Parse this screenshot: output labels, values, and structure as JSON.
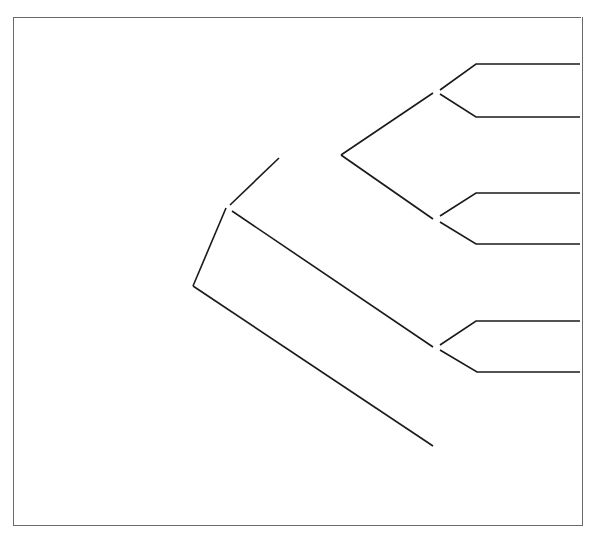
{
  "figure": {
    "caption": "A basic decision tree."
  },
  "nodes": {
    "decision1": {
      "line1": "DECISION",
      "line2": "1"
    },
    "decision2": {
      "line1": "DECISION",
      "line2": "2"
    }
  },
  "branches": {
    "continue": {
      "line1": "Continue",
      "line2": "project"
    },
    "abort": {
      "line1": "Abort",
      "line2": "project"
    },
    "success": "Success",
    "failure": "Failure",
    "launch": {
      "line1": "Launch",
      "line2": "immediately"
    },
    "postpone": {
      "line1": "Postpone",
      "line2": "launch"
    }
  },
  "outcomes": {
    "enter": "Competitors enter",
    "stay_line1": "Competitors",
    "stay_line2": "stay out"
  },
  "colors": {
    "line": "#1a1a1a",
    "frame": "#6a6a6a"
  }
}
